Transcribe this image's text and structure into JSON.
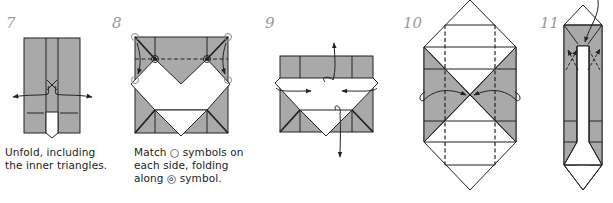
{
  "colors": {
    "paper_colored": "#a9a9a9",
    "paper_white": "#ffffff",
    "line": "#222222",
    "step_number": "#9a9a9a"
  },
  "steps": [
    {
      "number": "7",
      "caption_lines": [
        "Unfold, including",
        "the inner triangles."
      ]
    },
    {
      "number": "8",
      "caption_lines": [
        "Match ○ symbols on",
        "each side, folding",
        "along ◎ symbol."
      ]
    },
    {
      "number": "9",
      "caption_lines": []
    },
    {
      "number": "10",
      "caption_lines": []
    },
    {
      "number": "11",
      "caption_lines": []
    }
  ],
  "symbols": {
    "match_point": "circle-symbol",
    "pivot_point": "double-circle-symbol",
    "arrows": "fold-arrow"
  }
}
